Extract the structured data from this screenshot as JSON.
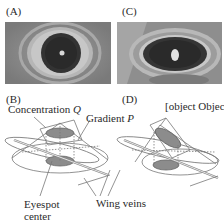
{
  "panels": {
    "A": {
      "label": "(A)"
    },
    "B": {
      "label": "(B)"
    },
    "C": {
      "label": "(C)"
    },
    "D": {
      "label": "(D)"
    }
  },
  "annotations": {
    "concentration": {
      "text": "Concentration ",
      "var": "Q"
    },
    "gradient_p": {
      "text": "Gradient ",
      "var": "P"
    },
    "gradient_q": {
      "text": "Gradient Q"
    },
    "eyespot_center_line1": "Eyespot",
    "eyespot_center_line2": "center",
    "wing_veins": "Wing veins"
  },
  "colors": {
    "photo_bg": "#8a8a8a",
    "eyespot_dark": "#2e2e2e",
    "ring_light": "#bdbdbd",
    "line": "#6a6a6a",
    "disc_fill": "#8c8c8c"
  }
}
